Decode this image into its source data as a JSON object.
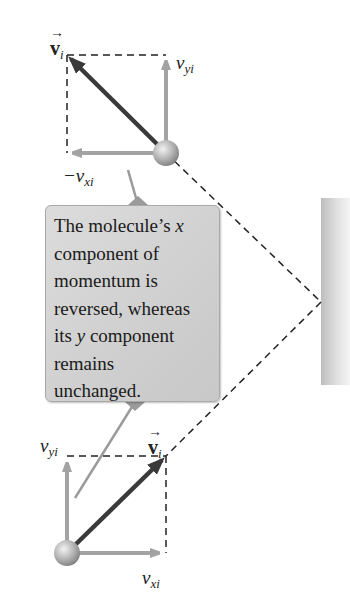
{
  "callout": {
    "line1_pre": "The molecule’s ",
    "line1_var": "x",
    "line2": "component of",
    "line3": "momentum is",
    "line4": "reversed, whereas",
    "line5_pre": "its ",
    "line5_var": "y",
    "line5_post": " component",
    "line6": "remains",
    "line7": "unchanged."
  },
  "labels": {
    "top_velocity_symbol": "v",
    "top_velocity_sub": "i",
    "top_vyi_base": "v",
    "top_vyi_sub": "yi",
    "top_vxi_base": "−v",
    "top_vxi_sub": "xi",
    "bottom_velocity_symbol": "v",
    "bottom_velocity_sub": "i",
    "bottom_vyi_base": "v",
    "bottom_vyi_sub": "yi",
    "bottom_vxi_base": "v",
    "bottom_vxi_sub": "xi",
    "vector_arrow": "→"
  },
  "colors": {
    "component_arrow": "#a3a3a3",
    "velocity_arrow": "#3a3a3a",
    "dashed_path": "#222222",
    "callout_bg": "#d2d2d2",
    "wall": "#d6d6d6"
  }
}
